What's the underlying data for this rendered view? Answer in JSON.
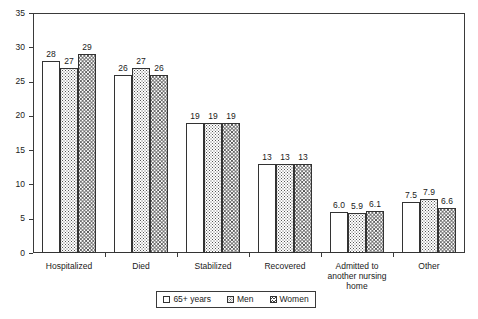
{
  "chart_data": {
    "type": "bar",
    "title": "",
    "xlabel": "",
    "ylabel": "",
    "ylim": [
      0,
      35
    ],
    "ytick_step": 5,
    "ytick_labels": [
      "0",
      "5",
      "10",
      "15",
      "20",
      "25",
      "30",
      "35"
    ],
    "grid": false,
    "legend_position": "bottom",
    "categories": [
      "Hospitalized",
      "Died",
      "Stabilized",
      "Recovered",
      "Admitted to\nanother nursing\nhome",
      "Other"
    ],
    "series": [
      {
        "name": "65+ years",
        "pattern": "empty",
        "values": [
          28,
          26,
          19,
          13,
          6.0,
          7.5
        ],
        "labels": [
          "28",
          "26",
          "19",
          "13",
          "6.0",
          "7.5"
        ]
      },
      {
        "name": "Men",
        "pattern": "dots",
        "values": [
          27,
          27,
          19,
          13,
          5.9,
          7.9
        ],
        "labels": [
          "27",
          "27",
          "19",
          "13",
          "5.9",
          "7.9"
        ]
      },
      {
        "name": "Women",
        "pattern": "zigzag",
        "values": [
          29,
          26,
          19,
          13,
          6.1,
          6.6
        ],
        "labels": [
          "29",
          "26",
          "19",
          "13",
          "6.1",
          "6.6"
        ]
      }
    ]
  },
  "colors": {
    "axis": "#3a3a3a",
    "bar_outline": "#333333",
    "bar_fill": "#ffffff",
    "text": "#1a1a1a",
    "background": "#ffffff"
  },
  "legend": {
    "items": [
      {
        "label": "65+ years",
        "pattern": "empty"
      },
      {
        "label": "Men",
        "pattern": "dots"
      },
      {
        "label": "Women",
        "pattern": "zigzag"
      }
    ]
  }
}
